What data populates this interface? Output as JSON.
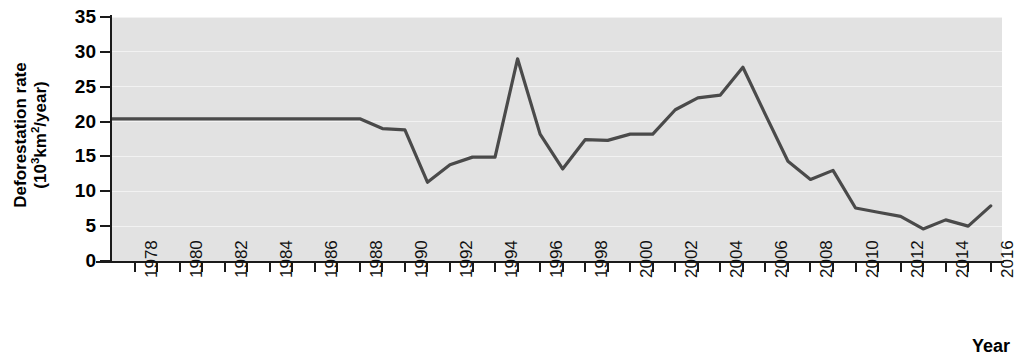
{
  "axes": {
    "ylabel_line1": "Deforestation rate",
    "ylabel_line2_pre": "(10",
    "ylabel_line2_sup": "3",
    "ylabel_line2_post": "km",
    "ylabel_line2_sup2": "2",
    "ylabel_line2_end": "/year)",
    "ylabel_full": "Deforestation rate (10³km²/year)",
    "xlabel": "Year",
    "ytick_labels": [
      "35",
      "30",
      "25",
      "20",
      "15",
      "10",
      "5",
      "0"
    ],
    "xtick_labels": [
      "1978",
      "1980",
      "1982",
      "1984",
      "1986",
      "1988",
      "1990",
      "1992",
      "1994",
      "1996",
      "1998",
      "2000",
      "2002",
      "2004",
      "2006",
      "2008",
      "2010",
      "2012",
      "2014",
      "2016"
    ]
  },
  "style": {
    "plot_background": "#e2e2e2",
    "gridline_color": "#f2f2f2",
    "line_color": "#4a4a4a",
    "axis_color": "#1a1a1a",
    "page_background": "#ffffff"
  },
  "chart_data": {
    "type": "line",
    "title": "",
    "xlabel": "Year",
    "ylabel": "Deforestation rate (10³km²/year)",
    "xlim": [
      1977,
      2016.5
    ],
    "ylim": [
      0,
      35
    ],
    "yticks": [
      0,
      5,
      10,
      15,
      20,
      25,
      30,
      35
    ],
    "xticks": [
      1978,
      1980,
      1982,
      1984,
      1986,
      1988,
      1990,
      1992,
      1994,
      1996,
      1998,
      2000,
      2002,
      2004,
      2006,
      2008,
      2010,
      2012,
      2014,
      2016
    ],
    "grid": true,
    "legend": false,
    "series": [
      {
        "name": "Deforestation rate",
        "x": [
          1977,
          1978,
          1979,
          1980,
          1981,
          1982,
          1983,
          1984,
          1985,
          1986,
          1987,
          1988,
          1989,
          1990,
          1991,
          1992,
          1993,
          1994,
          1995,
          1996,
          1997,
          1998,
          1999,
          2000,
          2001,
          2002,
          2003,
          2004,
          2005,
          2006,
          2007,
          2008,
          2009,
          2010,
          2011,
          2012,
          2013,
          2014,
          2015,
          2016
        ],
        "values": [
          20.4,
          20.4,
          20.4,
          20.4,
          20.4,
          20.4,
          20.4,
          20.4,
          20.4,
          20.4,
          20.4,
          20.4,
          19.0,
          18.8,
          11.3,
          13.8,
          14.9,
          14.9,
          29.0,
          18.2,
          13.2,
          17.4,
          17.3,
          18.2,
          18.2,
          21.7,
          23.4,
          23.8,
          27.8,
          21.0,
          14.3,
          11.7,
          13.0,
          7.6,
          7.0,
          6.4,
          4.6,
          5.9,
          5.0,
          7.9
        ]
      }
    ]
  }
}
